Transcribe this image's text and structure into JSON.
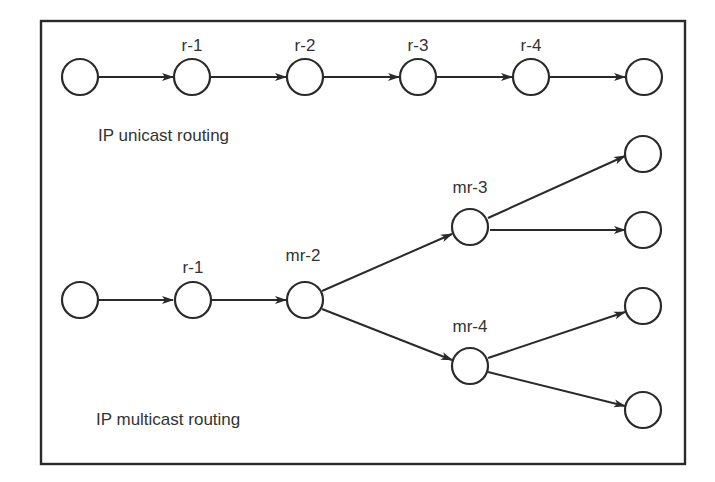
{
  "diagram": {
    "unicast": {
      "caption": "IP unicast routing",
      "labels": [
        "r-1",
        "r-2",
        "r-3",
        "r-4"
      ]
    },
    "multicast": {
      "caption": "IP multicast routing",
      "labels": [
        "r-1",
        "mr-2",
        "mr-3",
        "mr-4"
      ]
    },
    "colors": {
      "stroke": "#2a2a2a",
      "text": "#333333",
      "background": "#ffffff"
    }
  }
}
